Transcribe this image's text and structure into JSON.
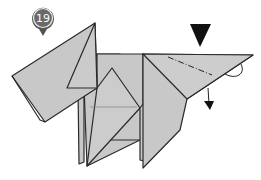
{
  "step": {
    "number": "19",
    "badge_color": "#555555",
    "badge_ring": "#e8e8e8"
  },
  "colors": {
    "paper": "#c8c8c8",
    "paper_light": "#d2d2d2",
    "stroke": "#2a2a2a",
    "arrow": "#111111",
    "background": "#ffffff"
  },
  "symbols": {
    "push_arrow": "push-in-arrow-icon",
    "fold_line": "valley-dash-dot-fold",
    "fold_arrow": "curved-fold-arrow-icon"
  }
}
